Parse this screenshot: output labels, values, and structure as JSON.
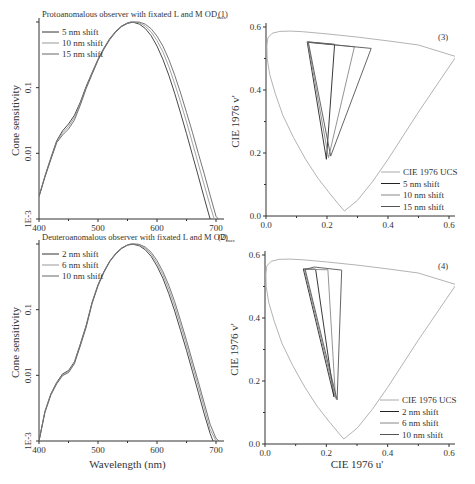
{
  "chart_data": [
    {
      "id": "panel-1",
      "type": "line",
      "title": "Protoanomalous observer with fixated L and M OD",
      "title_subscript": "max",
      "panel_label": "(1)",
      "xlabel": "",
      "ylabel": "Cone sensitivity",
      "xlim": [
        400,
        700
      ],
      "ylim": [
        0.001,
        1
      ],
      "yscale": "log",
      "xticks": [
        400,
        500,
        600,
        700
      ],
      "xtick_labels": [
        "400",
        "500",
        "600",
        "700"
      ],
      "yticks": [
        0.001,
        0.01,
        0.1
      ],
      "ytick_labels": [
        "1E-3",
        "0.01",
        "0.1"
      ],
      "legend_position": "top-left",
      "series": [
        {
          "name": "5 nm shift",
          "color": "#333333",
          "x": [
            400,
            410,
            420,
            430,
            440,
            450,
            460,
            470,
            480,
            490,
            500,
            510,
            520,
            530,
            540,
            550,
            556,
            560,
            570,
            580,
            590,
            600,
            610,
            620,
            630,
            640,
            650,
            660,
            670,
            680,
            690
          ],
          "y": [
            0.0022,
            0.0045,
            0.0085,
            0.0155,
            0.022,
            0.028,
            0.038,
            0.06,
            0.105,
            0.17,
            0.27,
            0.4,
            0.56,
            0.72,
            0.87,
            0.97,
            1.0,
            0.99,
            0.93,
            0.8,
            0.62,
            0.43,
            0.27,
            0.155,
            0.082,
            0.041,
            0.02,
            0.0095,
            0.0045,
            0.0021,
            0.001
          ]
        },
        {
          "name": "10 nm shift",
          "color": "#999999",
          "x": [
            400,
            410,
            420,
            430,
            440,
            450,
            460,
            470,
            480,
            490,
            500,
            510,
            520,
            530,
            540,
            550,
            558,
            565,
            570,
            580,
            590,
            600,
            610,
            620,
            630,
            640,
            650,
            660,
            670,
            680,
            690,
            697
          ],
          "y": [
            0.0022,
            0.0044,
            0.0082,
            0.015,
            0.0205,
            0.0255,
            0.035,
            0.057,
            0.1,
            0.165,
            0.265,
            0.39,
            0.55,
            0.71,
            0.86,
            0.96,
            1.0,
            0.99,
            0.97,
            0.87,
            0.71,
            0.52,
            0.35,
            0.21,
            0.115,
            0.06,
            0.03,
            0.0145,
            0.0069,
            0.0033,
            0.0016,
            0.001
          ]
        },
        {
          "name": "15 nm shift",
          "color": "#666666",
          "x": [
            400,
            410,
            420,
            430,
            440,
            450,
            460,
            470,
            480,
            490,
            500,
            510,
            520,
            530,
            540,
            550,
            560,
            565,
            570,
            580,
            590,
            600,
            610,
            620,
            630,
            640,
            650,
            660,
            670,
            680,
            690,
            700,
            704
          ],
          "y": [
            0.0022,
            0.0043,
            0.008,
            0.0145,
            0.019,
            0.0235,
            0.032,
            0.054,
            0.097,
            0.16,
            0.26,
            0.385,
            0.54,
            0.7,
            0.85,
            0.95,
            0.995,
            1.0,
            0.995,
            0.93,
            0.79,
            0.61,
            0.43,
            0.27,
            0.155,
            0.083,
            0.042,
            0.021,
            0.01,
            0.0049,
            0.0023,
            0.0011,
            0.001
          ]
        }
      ]
    },
    {
      "id": "panel-2",
      "type": "line",
      "title": "Deuteroanomalous observer with fixated L and M OD",
      "title_subscript": "max",
      "panel_label": "(2)",
      "xlabel": "Wavelength (nm)",
      "ylabel": "Cone sensitivity",
      "xlim": [
        400,
        700
      ],
      "ylim": [
        0.001,
        1
      ],
      "yscale": "log",
      "xticks": [
        400,
        500,
        600,
        700
      ],
      "xtick_labels": [
        "400",
        "500",
        "600",
        "700"
      ],
      "yticks": [
        0.001,
        0.01,
        0.1
      ],
      "ytick_labels": [
        "1E-3",
        "0.01",
        "0.1"
      ],
      "legend_position": "top-left",
      "series": [
        {
          "name": "2 nm shift",
          "color": "#333333",
          "x": [
            400,
            410,
            420,
            430,
            440,
            450,
            460,
            470,
            480,
            490,
            500,
            510,
            520,
            530,
            540,
            550,
            556,
            560,
            570,
            580,
            590,
            600,
            610,
            620,
            630,
            640,
            650,
            660,
            670,
            680,
            690,
            695
          ],
          "y": [
            0.001,
            0.0028,
            0.0052,
            0.0078,
            0.0105,
            0.0118,
            0.016,
            0.03,
            0.058,
            0.13,
            0.24,
            0.38,
            0.55,
            0.72,
            0.87,
            0.97,
            1.0,
            0.99,
            0.94,
            0.82,
            0.65,
            0.46,
            0.3,
            0.175,
            0.095,
            0.048,
            0.024,
            0.0115,
            0.0055,
            0.0026,
            0.0013,
            0.001
          ]
        },
        {
          "name": "6 nm shift",
          "color": "#999999",
          "x": [
            400,
            410,
            420,
            430,
            440,
            450,
            460,
            470,
            480,
            490,
            500,
            510,
            520,
            530,
            540,
            550,
            558,
            562,
            570,
            580,
            590,
            600,
            610,
            620,
            630,
            640,
            650,
            660,
            670,
            680,
            690,
            700
          ],
          "y": [
            0.001,
            0.0028,
            0.0051,
            0.0076,
            0.0102,
            0.0114,
            0.0155,
            0.029,
            0.056,
            0.127,
            0.235,
            0.375,
            0.545,
            0.71,
            0.86,
            0.965,
            1.0,
            0.998,
            0.96,
            0.86,
            0.7,
            0.51,
            0.34,
            0.205,
            0.113,
            0.058,
            0.029,
            0.014,
            0.0068,
            0.0032,
            0.0015,
            0.001
          ]
        },
        {
          "name": "10 nm shift",
          "color": "#666666",
          "x": [
            400,
            410,
            420,
            430,
            440,
            450,
            460,
            470,
            480,
            490,
            500,
            510,
            520,
            530,
            540,
            550,
            560,
            565,
            570,
            580,
            590,
            600,
            610,
            620,
            630,
            640,
            650,
            660,
            670,
            680,
            690,
            700,
            705
          ],
          "y": [
            0.001,
            0.0027,
            0.005,
            0.0074,
            0.0099,
            0.011,
            0.015,
            0.028,
            0.054,
            0.124,
            0.23,
            0.37,
            0.54,
            0.7,
            0.85,
            0.96,
            0.998,
            1.0,
            0.985,
            0.9,
            0.75,
            0.56,
            0.38,
            0.235,
            0.132,
            0.068,
            0.034,
            0.0165,
            0.008,
            0.0038,
            0.0018,
            0.0011,
            0.001
          ]
        }
      ]
    },
    {
      "id": "panel-3",
      "type": "line",
      "panel_label": "(3)",
      "xlabel": "",
      "ylabel": "CIE 1976 v'",
      "xlim": [
        0.0,
        0.63
      ],
      "ylim": [
        0.0,
        0.6
      ],
      "xticks": [
        0.0,
        0.2,
        0.4,
        0.6
      ],
      "xtick_labels": [
        "0.0",
        "0.2",
        "0.4",
        "0.6"
      ],
      "yticks": [
        0.0,
        0.2,
        0.4,
        0.6
      ],
      "ytick_labels": [
        "0.0",
        "0.2",
        "0.4",
        "0.6"
      ],
      "legend_position": "bottom-right",
      "series": [
        {
          "name": "CIE 1976 UCS",
          "color": "#aaaaaa",
          "closed": true,
          "x": [
            0.257,
            0.24,
            0.21,
            0.17,
            0.13,
            0.09,
            0.055,
            0.03,
            0.012,
            0.004,
            0.003,
            0.006,
            0.02,
            0.045,
            0.08,
            0.12,
            0.2,
            0.3,
            0.4,
            0.5,
            0.623,
            0.5,
            0.4,
            0.35,
            0.3
          ],
          "y": [
            0.016,
            0.035,
            0.07,
            0.12,
            0.18,
            0.25,
            0.32,
            0.39,
            0.45,
            0.5,
            0.54,
            0.565,
            0.58,
            0.586,
            0.587,
            0.585,
            0.578,
            0.568,
            0.556,
            0.543,
            0.506,
            0.33,
            0.18,
            0.11,
            0.05
          ]
        },
        {
          "name": "5 nm shift",
          "color": "#222222",
          "closed": true,
          "x": [
            0.135,
            0.225,
            0.198
          ],
          "y": [
            0.553,
            0.545,
            0.18
          ]
        },
        {
          "name": "10 nm shift",
          "color": "#888888",
          "closed": true,
          "x": [
            0.137,
            0.29,
            0.205
          ],
          "y": [
            0.552,
            0.537,
            0.185
          ]
        },
        {
          "name": "15 nm shift",
          "color": "#555555",
          "closed": true,
          "x": [
            0.139,
            0.345,
            0.212
          ],
          "y": [
            0.551,
            0.532,
            0.19
          ]
        }
      ]
    },
    {
      "id": "panel-4",
      "type": "line",
      "panel_label": "(4)",
      "xlabel": "CIE 1976 u'",
      "ylabel": "CIE 1976 v'",
      "xlim": [
        0.0,
        0.63
      ],
      "ylim": [
        0.0,
        0.6
      ],
      "xticks": [
        0.0,
        0.2,
        0.4,
        0.6
      ],
      "xtick_labels": [
        "0.0",
        "0.2",
        "0.4",
        "0.6"
      ],
      "yticks": [
        0.0,
        0.2,
        0.4,
        0.6
      ],
      "ytick_labels": [
        "0.0",
        "0.2",
        "0.4",
        "0.6"
      ],
      "legend_position": "bottom-right",
      "series": [
        {
          "name": "CIE 1976 UCS",
          "color": "#aaaaaa",
          "closed": true,
          "x": [
            0.257,
            0.24,
            0.21,
            0.17,
            0.13,
            0.09,
            0.055,
            0.03,
            0.012,
            0.004,
            0.003,
            0.006,
            0.02,
            0.045,
            0.08,
            0.12,
            0.2,
            0.3,
            0.4,
            0.5,
            0.623,
            0.5,
            0.4,
            0.35,
            0.3
          ],
          "y": [
            0.016,
            0.035,
            0.07,
            0.12,
            0.18,
            0.25,
            0.32,
            0.39,
            0.45,
            0.5,
            0.54,
            0.565,
            0.58,
            0.586,
            0.587,
            0.585,
            0.578,
            0.568,
            0.556,
            0.543,
            0.506,
            0.33,
            0.18,
            0.11,
            0.05
          ]
        },
        {
          "name": "2 nm shift",
          "color": "#222222",
          "closed": true,
          "x": [
            0.125,
            0.165,
            0.225
          ],
          "y": [
            0.556,
            0.555,
            0.15
          ]
        },
        {
          "name": "6 nm shift",
          "color": "#888888",
          "closed": true,
          "x": [
            0.128,
            0.205,
            0.23
          ],
          "y": [
            0.555,
            0.553,
            0.145
          ]
        },
        {
          "name": "10 nm shift",
          "color": "#555555",
          "closed": true,
          "x": [
            0.131,
            0.16,
            0.25,
            0.235
          ],
          "y": [
            0.554,
            0.562,
            0.552,
            0.14
          ]
        }
      ]
    }
  ]
}
